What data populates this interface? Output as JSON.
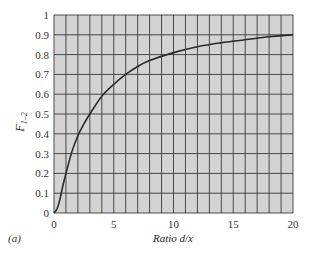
{
  "chart_data": {
    "type": "line",
    "title": "",
    "xlabel": "Ratio d/x",
    "ylabel": "F1-2",
    "xlim": [
      0,
      20
    ],
    "ylim": [
      0,
      1
    ],
    "grid": true,
    "grid_minor_x_step": 1,
    "grid_y_step": 0.1,
    "x_ticks": [
      0,
      5,
      10,
      15,
      20
    ],
    "y_ticks": [
      0,
      0.1,
      0.2,
      0.3,
      0.4,
      0.5,
      0.6,
      0.7,
      0.8,
      0.9,
      1
    ],
    "x_tick_labels": [
      "0",
      "5",
      "10",
      "15",
      "20"
    ],
    "y_tick_labels": [
      "0",
      "0.1",
      "0.2",
      "0.3",
      "0.4",
      "0.5",
      "0.6",
      "0.7",
      "0.8",
      "0.9",
      "1"
    ],
    "series": [
      {
        "name": "F1-2",
        "x": [
          0,
          0.25,
          0.5,
          0.75,
          1,
          1.5,
          2,
          2.5,
          3,
          4,
          5,
          6,
          7,
          8,
          10,
          12,
          14,
          16,
          18,
          20
        ],
        "y": [
          0,
          0.02,
          0.07,
          0.14,
          0.2,
          0.31,
          0.39,
          0.45,
          0.5,
          0.59,
          0.65,
          0.7,
          0.74,
          0.77,
          0.81,
          0.84,
          0.86,
          0.875,
          0.89,
          0.9
        ]
      }
    ],
    "legend": null
  },
  "labels": {
    "ylabel_main": "F",
    "ylabel_sub": "1–2",
    "xlabel": "Ratio d/x",
    "caption": "(a)"
  },
  "colors": {
    "plot_background": "#d3d3d3",
    "grid": "#3a3a3a",
    "curve": "#2a2a2a"
  }
}
